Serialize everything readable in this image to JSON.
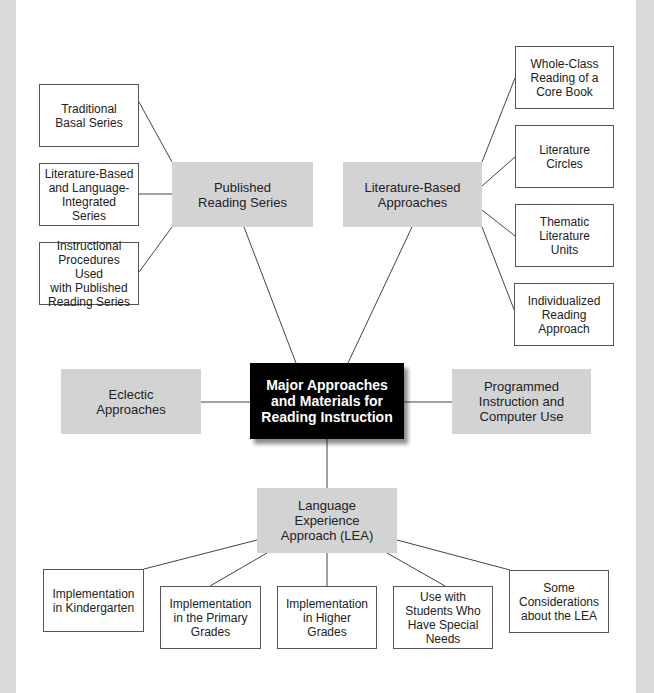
{
  "diagram": {
    "central": "Major Approaches\nand Materials for\nReading Instruction",
    "branches": {
      "published": {
        "label": "Published\nReading Series",
        "children": [
          "Traditional\nBasal Series",
          "Literature-Based\nand Language-\nIntegrated Series",
          "Instructional\nProcedures Used\nwith Published\nReading Series"
        ]
      },
      "literature": {
        "label": "Literature-Based\nApproaches",
        "children": [
          "Whole-Class\nReading of a\nCore Book",
          "Literature\nCircles",
          "Thematic\nLiterature\nUnits",
          "Individualized\nReading\nApproach"
        ]
      },
      "eclectic": {
        "label": "Eclectic\nApproaches"
      },
      "programmed": {
        "label": "Programmed\nInstruction and\nComputer Use"
      },
      "lea": {
        "label": "Language\nExperience\nApproach (LEA)",
        "children": [
          "Implementation\nin Kindergarten",
          "Implementation\nin the Primary\nGrades",
          "Implementation\nin Higher\nGrades",
          "Use with\nStudents Who\nHave Special\nNeeds",
          "Some\nConsiderations\nabout the LEA"
        ]
      }
    }
  },
  "colors": {
    "central_bg": "#000000",
    "branch_bg": "#d3d3d3",
    "leaf_border": "#555555",
    "side_strip": "#d9d9d9"
  }
}
